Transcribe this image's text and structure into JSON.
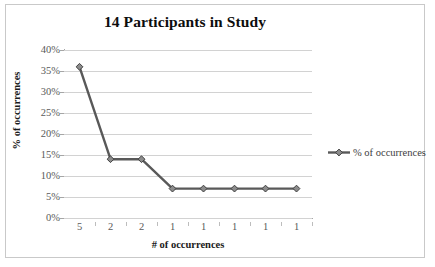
{
  "chart_data": {
    "type": "line",
    "title": "14 Participants in Study",
    "xlabel": "# of occurrences",
    "ylabel": "% of occurrences",
    "categories": [
      "5",
      "2",
      "2",
      "1",
      "1",
      "1",
      "1",
      "1"
    ],
    "series": [
      {
        "name": "% of occurrences",
        "values": [
          36,
          14,
          14,
          7,
          7,
          7,
          7,
          7
        ],
        "color": "#595959",
        "marker": "diamond"
      }
    ],
    "ylim": [
      0,
      40
    ],
    "ytick_labels": [
      "0%",
      "5%",
      "10%",
      "15%",
      "20%",
      "25%",
      "30%",
      "35%",
      "40%"
    ],
    "ytick_values": [
      0,
      5,
      10,
      15,
      20,
      25,
      30,
      35,
      40
    ],
    "grid": true,
    "legend_position": "right"
  },
  "legend": {
    "entries": [
      {
        "label": "% of occurrences",
        "color": "#595959"
      }
    ]
  },
  "frame": {
    "border_color": "#c9c9c9",
    "background": "#ffffff",
    "gridline_color": "#d2d2d2",
    "axis_color": "#a6a6a6"
  }
}
